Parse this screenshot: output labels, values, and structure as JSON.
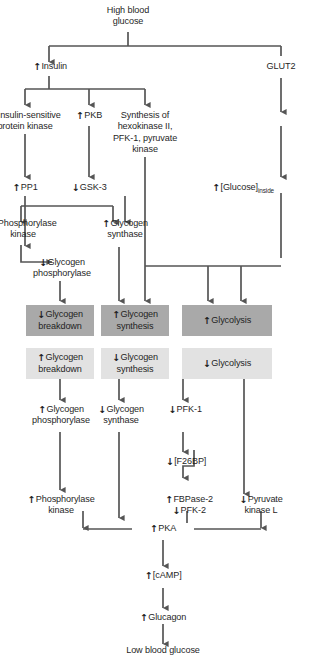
{
  "diagram": {
    "colors": {
      "dark_box": "#a9a9a9",
      "light_box": "#e2e2e2",
      "line": "#555555",
      "text": "#1f1f1f",
      "background": "#ffffff"
    },
    "arrow_up": "↑",
    "arrow_down": "↓"
  },
  "nodes": {
    "high_blood_glucose": "High blood\nglucose",
    "insulin": "Insulin",
    "glut2": "GLUT2",
    "insulin_sensitive_protein_kinase": "Insulin-sensitive\nprotein kinase",
    "pkb": "PKB",
    "synthesis_enzymes": "Synthesis of\nhexokinase II,\nPFK-1, pyruvate\nkinase",
    "pp1": "PP1",
    "gsk3": "GSK-3",
    "glucose_inside_pre": "[Glucose]",
    "glucose_inside_sub": "inside",
    "phosphorylase_kinase_top": "Phosphorylase\nkinase",
    "glycogen_synthase_top": "Glycogen\nsynthase",
    "glycogen_phosphorylase_top": "Glycogen\nphosphorylase",
    "glycogen_breakdown_dark": "Glycogen\nbreakdown",
    "glycogen_synthesis_dark": "Glycogen\nsynthesis",
    "glycolysis_dark": "Glycolysis",
    "glycogen_breakdown_light": "Glycogen\nbreakdown",
    "glycogen_synthesis_light": "Glycogen\nsynthesis",
    "glycolysis_light": "Glycolysis",
    "glycogen_phosphorylase_bottom": "Glycogen\nphosphorylase",
    "glycogen_synthase_bottom": "Glycogen\nsynthase",
    "pfk1": "PFK-1",
    "f26bp": "[F26BP]",
    "phosphorylase_kinase_bottom": "Phosphorylase\nkinase",
    "fbpase2": "FBPase-2",
    "pfk2": "PFK-2",
    "pyruvate_kinase_l": "Pyruvate\nkinase L",
    "pka": "PKA",
    "camp": "[cAMP]",
    "glucagon": "Glucagon",
    "low_blood_glucose": "Low blood glucose"
  },
  "arrows": {
    "insulin": "↑",
    "insulin_sensitive_protein_kinase": "↑",
    "pkb": "↑",
    "pp1": "↑",
    "gsk3": "↓",
    "glucose_inside": "↑",
    "phosphorylase_kinase_top": "↓",
    "glycogen_synthase_top": "↑",
    "glycogen_phosphorylase_top": "↓",
    "glycogen_breakdown_dark": "↓",
    "glycogen_synthesis_dark": "↑",
    "glycolysis_dark": "↑",
    "glycogen_breakdown_light": "↑",
    "glycogen_synthesis_light": "↓",
    "glycolysis_light": "↓",
    "glycogen_phosphorylase_bottom": "↑",
    "glycogen_synthase_bottom": "↓",
    "pfk1": "↓",
    "f26bp": "↓",
    "phosphorylase_kinase_bottom": "↑",
    "fbpase2": "↑",
    "pfk2": "↓",
    "pyruvate_kinase_l": "↓",
    "pka": "↑",
    "camp": "↑",
    "glucagon": "↑"
  }
}
